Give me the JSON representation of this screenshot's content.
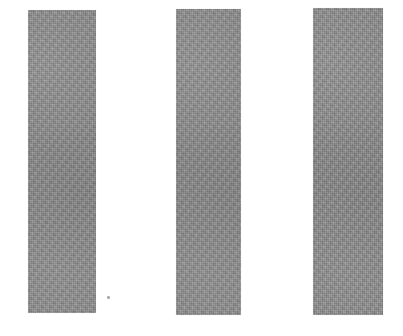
{
  "image": {
    "kind": "scanned-photo",
    "subject": "three vertical gray bars on white background",
    "caption": "Three gray vertical bars",
    "width_px": 403,
    "height_px": 336,
    "background_color": "#fefefe",
    "bar_color": "#8b8b8b",
    "speck_color": "#9a9a9a"
  },
  "bars": [
    {
      "id": "bar-1",
      "label": "left bar",
      "x": 28,
      "y": 10,
      "width": 68,
      "height": 303,
      "color": "#8b8b8b"
    },
    {
      "id": "bar-2",
      "label": "middle bar",
      "x": 176,
      "y": 9,
      "width": 65,
      "height": 306,
      "color": "#8b8b8b"
    },
    {
      "id": "bar-3",
      "label": "right bar",
      "x": 313,
      "y": 8,
      "width": 70,
      "height": 307,
      "color": "#8b8b8b"
    }
  ],
  "marks": [
    {
      "id": "speck",
      "label": "dust speck",
      "x": 107,
      "y": 296,
      "size": 3,
      "color": "#9a9a9a"
    }
  ]
}
